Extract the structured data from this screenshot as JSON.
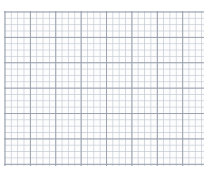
{
  "figure": {
    "width": 210,
    "height": 170,
    "background_color": "#ffffff"
  },
  "grid": {
    "minor_cell_px": 6.35,
    "major_cell_px": 25.4,
    "minor_color": "#c4cad4",
    "major_color": "#969eaa",
    "area": {
      "x": 4,
      "y": 11,
      "width": 200,
      "height": 155
    }
  },
  "line_of_reflection": {
    "label": "s",
    "label_x": 108,
    "label_y": 43,
    "x": 103.5,
    "y_top": 14,
    "y_bottom": 163,
    "style": "dashed",
    "color": "#111111",
    "arrow_both_ends": true
  },
  "shapes": [
    {
      "name": "pentagon-klmno",
      "id": "preimage",
      "stroke": "#111111",
      "stroke_width": 2.1,
      "fill": "none",
      "vertices": [
        {
          "label": "K",
          "x": 58,
          "y": 44,
          "label_x": 57,
          "label_y": 33
        },
        {
          "label": "L",
          "x": 82,
          "y": 70,
          "label_x": 89,
          "label_y": 73
        },
        {
          "label": "M",
          "x": 62,
          "y": 128,
          "label_x": 58,
          "label_y": 139
        },
        {
          "label": "N",
          "x": 28,
          "y": 108,
          "label_x": 16,
          "label_y": 112
        },
        {
          "label": "O",
          "x": 28,
          "y": 62,
          "label_x": 16,
          "label_y": 58
        }
      ]
    },
    {
      "name": "pentagon-klmno-prime",
      "id": "image",
      "stroke": "#111111",
      "stroke_width": 2.1,
      "fill": "none",
      "vertices": [
        {
          "label": "K'",
          "x": 149,
          "y": 44,
          "label_x": 149,
          "label_y": 33
        },
        {
          "label": "L'",
          "x": 125,
          "y": 70,
          "label_x": 117,
          "label_y": 73
        },
        {
          "label": "M'",
          "x": 145,
          "y": 128,
          "label_x": 148,
          "label_y": 139
        },
        {
          "label": "N'",
          "x": 179,
          "y": 108,
          "label_x": 190,
          "label_y": 112
        },
        {
          "label": "O'",
          "x": 179,
          "y": 62,
          "label_x": 190,
          "label_y": 58
        }
      ]
    }
  ]
}
